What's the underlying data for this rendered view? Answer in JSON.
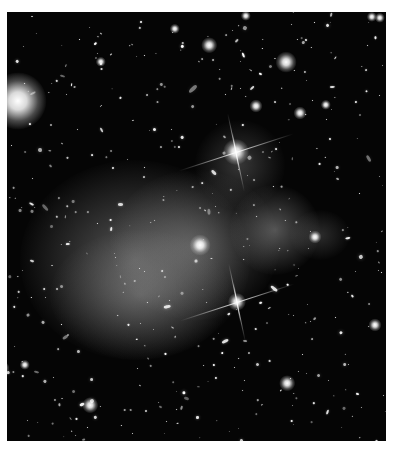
{
  "image": {
    "subject": "galaxy cluster with diffuse glow",
    "tone": "grayscale",
    "frame": {
      "x": 7,
      "y": 12,
      "w": 379,
      "h": 429,
      "border_color": "#ffffff",
      "bg_color": "#050505"
    }
  },
  "glows": [
    {
      "x": 20,
      "y": 160,
      "w": 230,
      "h": 200,
      "o": 0.42
    },
    {
      "x": 110,
      "y": 170,
      "w": 170,
      "h": 150,
      "o": 0.35
    },
    {
      "x": 230,
      "y": 185,
      "w": 90,
      "h": 90,
      "o": 0.4
    },
    {
      "x": 50,
      "y": 230,
      "w": 180,
      "h": 130,
      "o": 0.3
    },
    {
      "x": 195,
      "y": 120,
      "w": 90,
      "h": 90,
      "o": 0.25
    },
    {
      "x": 290,
      "y": 210,
      "w": 60,
      "h": 50,
      "o": 0.2
    }
  ],
  "bright_stars": [
    {
      "x": 18,
      "y": 101,
      "r": 22,
      "spikes": false
    },
    {
      "x": 236,
      "y": 152,
      "r": 10,
      "spikes": true
    },
    {
      "x": 237,
      "y": 302,
      "r": 7,
      "spikes": true
    },
    {
      "x": 286,
      "y": 62,
      "r": 8,
      "spikes": false
    },
    {
      "x": 200,
      "y": 245,
      "r": 8,
      "spikes": false
    },
    {
      "x": 209,
      "y": 45,
      "r": 6,
      "spikes": false
    },
    {
      "x": 372,
      "y": 17,
      "r": 4,
      "spikes": false
    },
    {
      "x": 380,
      "y": 18,
      "r": 4,
      "spikes": false
    },
    {
      "x": 287,
      "y": 383,
      "r": 6,
      "spikes": false
    },
    {
      "x": 90,
      "y": 405,
      "r": 6,
      "spikes": false
    },
    {
      "x": 315,
      "y": 237,
      "r": 5,
      "spikes": false
    },
    {
      "x": 375,
      "y": 325,
      "r": 5,
      "spikes": false
    },
    {
      "x": 3,
      "y": 368,
      "r": 5,
      "spikes": false
    },
    {
      "x": 256,
      "y": 106,
      "r": 5,
      "spikes": false
    },
    {
      "x": 300,
      "y": 113,
      "r": 5,
      "spikes": false
    },
    {
      "x": 326,
      "y": 105,
      "r": 4,
      "spikes": false
    },
    {
      "x": 101,
      "y": 62,
      "r": 4,
      "spikes": false
    },
    {
      "x": 175,
      "y": 29,
      "r": 4,
      "spikes": false
    },
    {
      "x": 246,
      "y": 16,
      "r": 4,
      "spikes": false
    },
    {
      "x": 25,
      "y": 365,
      "r": 4,
      "spikes": false
    }
  ]
}
